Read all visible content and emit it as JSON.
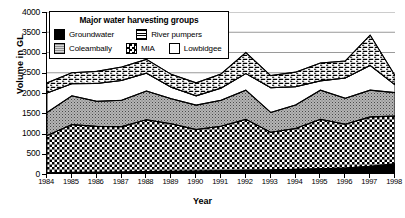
{
  "chart_data": {
    "type": "area",
    "subtype": "stacked-area",
    "title": "",
    "xlabel": "Year",
    "ylabel": "Volume in GL",
    "categories": [
      "1984",
      "1985",
      "1986",
      "1987",
      "1988",
      "1989",
      "1990",
      "1991",
      "1992",
      "1993",
      "1994",
      "1995",
      "1996",
      "1997",
      "1998"
    ],
    "x": [
      1984,
      1985,
      1986,
      1987,
      1988,
      1989,
      1990,
      1991,
      1992,
      1993,
      1994,
      1995,
      1996,
      1997,
      1998
    ],
    "ylim": [
      0,
      4000
    ],
    "ytick_labels": [
      "0",
      "500",
      "1000",
      "1500",
      "2000",
      "2500",
      "3000",
      "3500",
      "4000"
    ],
    "ytick_values": [
      0,
      500,
      1000,
      1500,
      2000,
      2500,
      3000,
      3500,
      4000
    ],
    "grid": "horizontal",
    "legend_position": "top-left-inside",
    "stack_order_bottom_to_top": [
      "Groundwater",
      "MIA",
      "Coleambally",
      "Lowbidgee",
      "River pumpers"
    ],
    "series": [
      {
        "name": "Groundwater",
        "pattern": "solid-black",
        "values": [
          30,
          40,
          45,
          50,
          60,
          65,
          70,
          80,
          90,
          100,
          115,
          130,
          150,
          190,
          250
        ]
      },
      {
        "name": "MIA",
        "pattern": "checkerboard",
        "values": [
          920,
          1180,
          1130,
          1120,
          1280,
          1175,
          1030,
          1100,
          1260,
          930,
          1010,
          1220,
          1080,
          1220,
          1180
        ]
      },
      {
        "name": "Coleambally",
        "pattern": "stipple-gray",
        "values": [
          570,
          710,
          620,
          650,
          710,
          620,
          600,
          640,
          720,
          490,
          580,
          720,
          640,
          660,
          580
        ]
      },
      {
        "name": "Lowbidgee",
        "pattern": "white",
        "values": [
          480,
          300,
          440,
          490,
          440,
          280,
          230,
          300,
          410,
          610,
          450,
          230,
          500,
          610,
          190
        ]
      },
      {
        "name": "River pumpers",
        "pattern": "diagonal-hatch",
        "values": [
          250,
          270,
          300,
          330,
          340,
          320,
          320,
          350,
          520,
          300,
          360,
          440,
          420,
          750,
          230
        ]
      }
    ],
    "cumulative_totals": [
      2250,
      2500,
      2535,
      2640,
      2830,
      2460,
      2250,
      2470,
      3000,
      2430,
      2515,
      2740,
      2790,
      3430,
      2430
    ]
  },
  "legend": {
    "title": "Major water harvesting groups",
    "items": [
      {
        "label": "Groundwater",
        "swatch": "solid-black"
      },
      {
        "label": "River pumpers",
        "swatch": "diagonal-hatch"
      },
      {
        "label": "Coleambally",
        "swatch": "stipple-gray"
      },
      {
        "label": "MIA",
        "swatch": "checkerboard"
      },
      {
        "label": "Lowbidgee",
        "swatch": "white"
      }
    ]
  },
  "axes": {
    "y_title": "Volume in GL",
    "x_title": "Year",
    "y_ticks": [
      "4000",
      "3500",
      "3000",
      "2500",
      "2000",
      "1500",
      "1000",
      "500",
      "0"
    ],
    "x_ticks": [
      "1984",
      "1985",
      "1986",
      "1987",
      "1988",
      "1989",
      "1990",
      "1991",
      "1992",
      "1993",
      "1994",
      "1995",
      "1996",
      "1997",
      "1998"
    ]
  },
  "colors": {
    "axis": "#000000",
    "grid": "#808080",
    "background": "#ffffff",
    "groundwater": "#000000",
    "coleambally": "#9a9a9a",
    "mia": "#000000",
    "lowbidgee": "#ffffff",
    "river_pumpers": "#000000"
  }
}
